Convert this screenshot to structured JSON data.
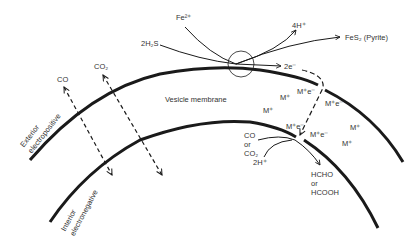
{
  "diagram": {
    "type": "membrane-reaction-schematic",
    "labels": {
      "fe": "Fe²⁺",
      "h2s": "2H₂S",
      "h4": "4H⁺",
      "pyrite": "FeS₂ (Pyrite)",
      "electrons": "2e⁻",
      "co": "CO",
      "co2": "CO₂",
      "membrane": "Vesicle membrane",
      "exterior_line1": "Exterior",
      "exterior_line2": "electropositive",
      "interior_line1": "Interior",
      "interior_line2": "electronegative",
      "m1": "M⁺e⁻",
      "m2": "M⁺",
      "m3": "M⁺",
      "m4": "M⁺e⁻",
      "m5": "M⁺e⁻",
      "m6": "M⁺e⁻",
      "m7": "M⁺",
      "m8": "M⁺",
      "substrate_line1": "CO",
      "substrate_line2": "or",
      "substrate_line3": "CO₂",
      "protons": "2H⁺",
      "product_line1": "HCHO",
      "product_line2": "or",
      "product_line3": "HCOOH"
    },
    "colors": {
      "line": "#1a1a1a",
      "text": "#333333",
      "background": "#ffffff"
    }
  }
}
